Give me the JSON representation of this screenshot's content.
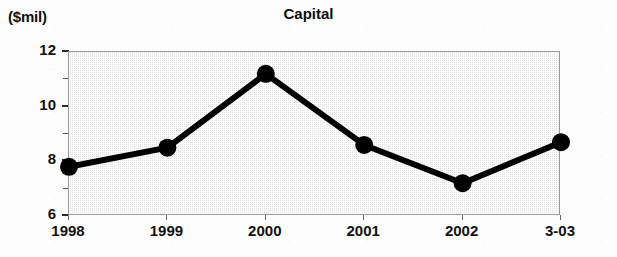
{
  "chart_data": {
    "type": "line",
    "title": "Capital",
    "unit_label": "($mil)",
    "xlabel": "",
    "ylabel": "($mil)",
    "categories": [
      "1998",
      "1999",
      "2000",
      "2001",
      "2002",
      "3-03"
    ],
    "values": [
      7.8,
      8.5,
      11.2,
      8.6,
      7.2,
      8.7
    ],
    "series": [
      {
        "name": "Capital",
        "values": [
          7.8,
          8.5,
          11.2,
          8.6,
          7.2,
          8.7
        ]
      }
    ],
    "ylim": [
      6,
      12
    ],
    "y_major_ticks": [
      "12",
      "10",
      "8",
      "6"
    ],
    "y_major_values": [
      12,
      10,
      8,
      6
    ],
    "y_minor_values": [
      11,
      9,
      7
    ],
    "grid": false,
    "legend": "none",
    "marker": "filled-circle",
    "line_color": "#000000",
    "marker_color": "#000000",
    "plot_background": "#e3e3e3",
    "frame_color": "#9a9a9a"
  },
  "axis": {
    "y_labels": [
      {
        "text": "12",
        "value": 12
      },
      {
        "text": "10",
        "value": 10
      },
      {
        "text": "8",
        "value": 8
      },
      {
        "text": "6",
        "value": 6
      }
    ],
    "x_labels": [
      {
        "text": "1998"
      },
      {
        "text": "1999"
      },
      {
        "text": "2000"
      },
      {
        "text": "2001"
      },
      {
        "text": "2002"
      },
      {
        "text": "3-03"
      }
    ]
  }
}
